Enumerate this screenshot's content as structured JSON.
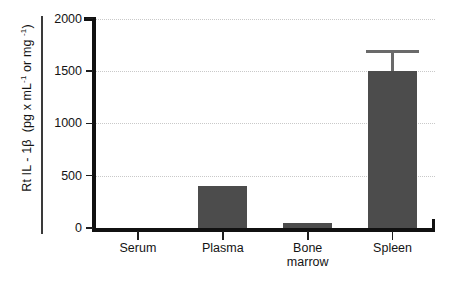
{
  "chart_data": {
    "type": "bar",
    "title": "",
    "xlabel": "",
    "ylabel": "Rt IL - 1β  (pg x mL⁻¹ or mg ⁻¹)",
    "ylabel_parts": {
      "main": "Rt IL - 1β",
      "units_prefix": "(pg x mL",
      "units_sup1": "-1",
      "units_middle": " or mg ",
      "units_sup2": "-1",
      "units_suffix": ")"
    },
    "categories": [
      "Serum",
      "Plasma",
      "Bone marrow",
      "Spleen"
    ],
    "category_lines": [
      [
        "Serum"
      ],
      [
        "Plasma"
      ],
      [
        "Bone",
        "marrow"
      ],
      [
        "Spleen"
      ]
    ],
    "values": [
      0,
      400,
      50,
      1500
    ],
    "errors": [
      0,
      0,
      0,
      200
    ],
    "ylim": [
      0,
      2000
    ],
    "yticks": [
      0,
      500,
      1000,
      1500,
      2000
    ],
    "ytick_labels": [
      "0",
      "500",
      "1000",
      "1500",
      "2000"
    ],
    "grid": true,
    "grid_style": "dotted",
    "legend": "none",
    "bar_color": "#4c4c4c",
    "error_color": "#6a6a6a",
    "axis_color": "#111111",
    "grid_color": "#c9c9c9"
  }
}
